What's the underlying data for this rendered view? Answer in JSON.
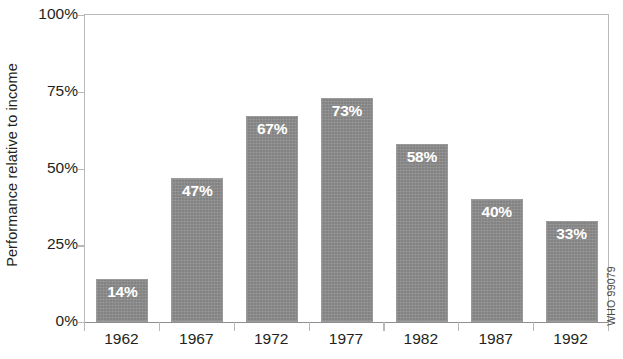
{
  "chart_data": {
    "type": "bar",
    "title": "",
    "xlabel": "",
    "ylabel": "Performance relative to income",
    "categories": [
      "1962",
      "1967",
      "1972",
      "1977",
      "1982",
      "1987",
      "1992"
    ],
    "values": [
      14,
      47,
      67,
      73,
      58,
      40,
      33
    ],
    "value_labels": [
      "14%",
      "47%",
      "67%",
      "73%",
      "58%",
      "40%",
      "33%"
    ],
    "ylim": [
      0,
      100
    ],
    "y_ticks": [
      0,
      25,
      50,
      75,
      100
    ],
    "y_tick_labels": [
      "0%",
      "25%",
      "50%",
      "75%",
      "100%"
    ],
    "grid": false,
    "legend": false,
    "bar_color": "#838383",
    "value_label_color": "#ffffff",
    "axis_color": "#b9b9b9",
    "text_color": "#231f20"
  },
  "credit": {
    "text": "WHO 99079"
  }
}
